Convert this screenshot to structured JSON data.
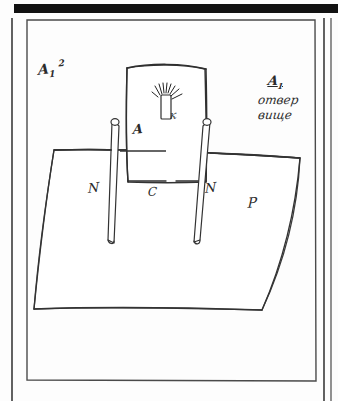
{
  "page": {
    "kind": "scanned-handwritten-technical-sketch",
    "width": 338,
    "height": 401,
    "paper_color": "#fdfdfd",
    "ink_color": "#2b2b2b",
    "scan_bar_color": "#111111"
  },
  "frame": {
    "outer_rule_left": "vertical-rule",
    "outer_rule_right": "vertical-rule",
    "inner_box": "rectangular-border"
  },
  "annotations": {
    "top_left": {
      "letter": "A",
      "subscript": "1",
      "trailing": "2"
    },
    "right_note": {
      "heading": "A",
      "heading_subscript": "1",
      "line2": "отвер",
      "line3": "вище"
    }
  },
  "drawing": {
    "panel_label": "A",
    "slot_label": "к",
    "rail_left_label": "N",
    "rail_right_label": "N",
    "center_label": "C",
    "body_label": "P"
  },
  "parts": [
    {
      "id": "panel",
      "name": "upper-panel",
      "label": "A"
    },
    {
      "id": "slot",
      "name": "slot-with-spray",
      "label": "к"
    },
    {
      "id": "rail-left",
      "name": "left-rail",
      "label": "N"
    },
    {
      "id": "rail-right",
      "name": "right-rail",
      "label": "N"
    },
    {
      "id": "center-edge",
      "name": "center-edge",
      "label": "C"
    },
    {
      "id": "body",
      "name": "main-body-trapezoid",
      "label": "P"
    }
  ]
}
